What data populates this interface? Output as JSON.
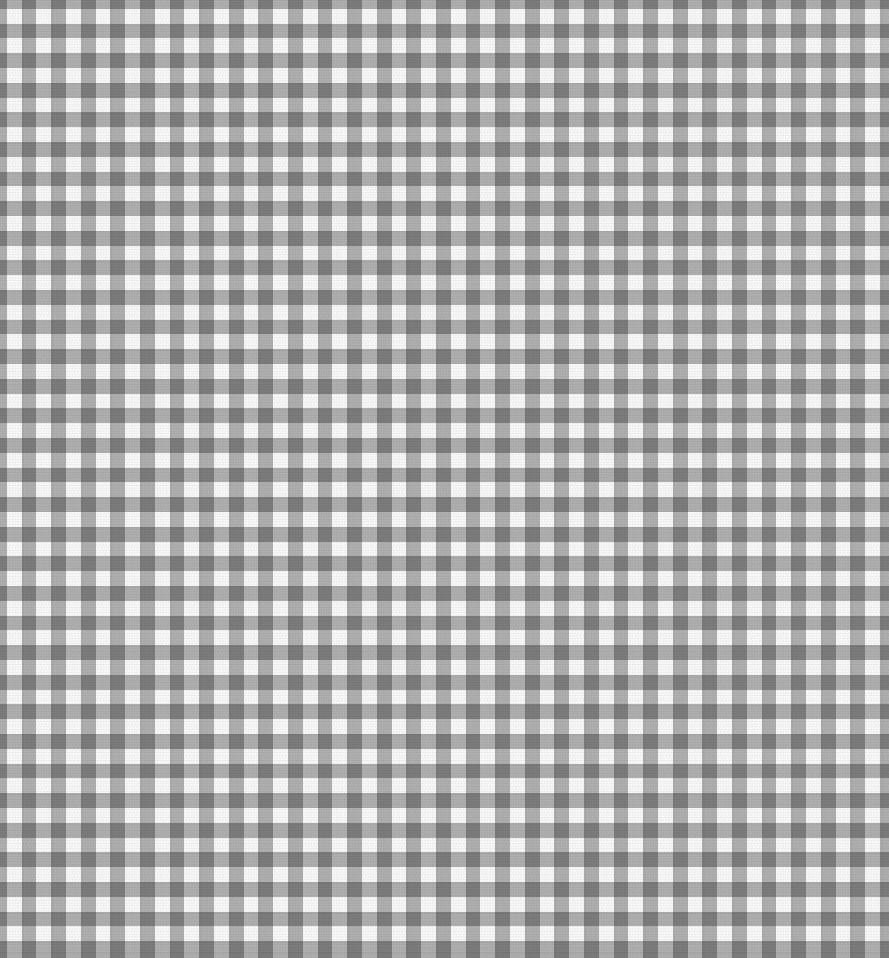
{
  "image": {
    "subject": "gingham-check-fabric",
    "description": "Gray and white gingham check fabric swatch, flat top-down view",
    "width_px": 889,
    "height_px": 958
  },
  "pattern": {
    "name": "gingham-check",
    "weave": "plain-weave",
    "orientation": "square-grid",
    "pitch_px": 29.6,
    "band_width_px": 14.8,
    "phase_x_px": -8,
    "phase_y_px": -6,
    "weave_cell_px": 2.6,
    "columns_visible": 30,
    "rows_visible": 32
  },
  "colors": {
    "white_cell": "#ffffff",
    "light_cell": "#dcdcdc",
    "dark_cell": "#9a9a9a",
    "stripe_band": "#b4b4b4",
    "background": "#ffffff"
  },
  "labels": {
    "alt_text": "Gray and white gingham check fabric swatch"
  }
}
